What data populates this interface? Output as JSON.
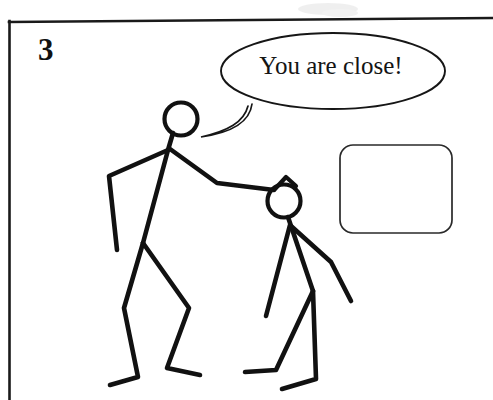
{
  "panel": {
    "number": "3",
    "frame_color": "#1a1a1a",
    "background_color": "#ffffff",
    "ink_color": "#111111"
  },
  "speech_bubble": {
    "text": "You are close!",
    "speaker": "tall-stick-figure",
    "shape": "ellipse"
  },
  "empty_box": {
    "label": "",
    "shape": "rounded-rectangle"
  },
  "figures": [
    {
      "name": "tall-stick-figure",
      "role": "speaker",
      "description": "standing figure with hand on the shorter figure's head"
    },
    {
      "name": "short-stick-figure",
      "role": "listener",
      "description": "bending figure with arms spread"
    }
  ]
}
